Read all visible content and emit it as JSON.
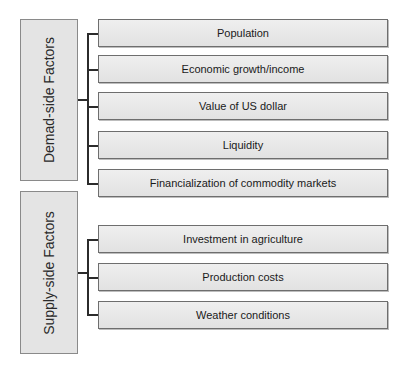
{
  "demand": {
    "label": "Demad-side Factors",
    "items": [
      "Population",
      "Economic growth/income",
      "Value of US dollar",
      "Liquidity",
      "Financialization of commodity markets"
    ]
  },
  "supply": {
    "label": "Supply-side Factors",
    "items": [
      "Investment in agriculture",
      "Production costs",
      "Weather conditions"
    ]
  }
}
